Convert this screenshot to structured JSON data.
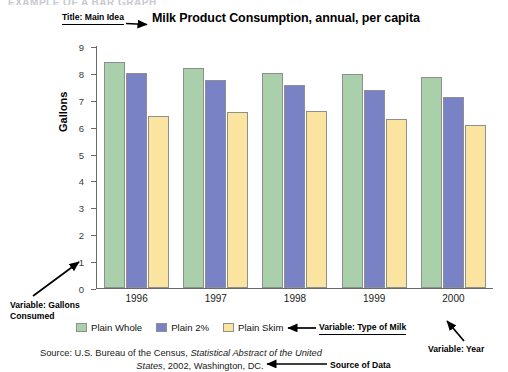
{
  "page": {
    "cutoff_header": "EXAMPLE OF A BAR GRAPH"
  },
  "chart_data": {
    "type": "bar",
    "title": "Milk Product Consumption, annual, per capita",
    "xlabel": "",
    "ylabel": "Gallons",
    "ylim": [
      0,
      9
    ],
    "yticks": [
      "0",
      "1",
      "2",
      "3",
      "4",
      "5",
      "6",
      "7",
      "8",
      "9"
    ],
    "grid": false,
    "legend_position": "bottom-left",
    "categories": [
      "1996",
      "1997",
      "1998",
      "1999",
      "2000"
    ],
    "series": [
      {
        "name": "Plain Whole",
        "color": "#a9cfab",
        "values": [
          8.4,
          8.2,
          8.0,
          7.95,
          7.85
        ]
      },
      {
        "name": "Plain 2%",
        "color": "#7a82c6",
        "values": [
          8.0,
          7.75,
          7.55,
          7.35,
          7.1
        ]
      },
      {
        "name": "Plain Skim",
        "color": "#fbe3a0",
        "values": [
          6.4,
          6.55,
          6.6,
          6.3,
          6.05
        ]
      }
    ]
  },
  "annotations": {
    "title_callout": "Title: Main Idea",
    "y_variable_callout": "Variable: Gallons Consumed",
    "series_variable_callout": "Variable: Type of Milk",
    "x_variable_callout": "Variable: Year",
    "source_callout": "Source of Data"
  },
  "source": {
    "line1_a": "Source: U.S. Bureau of the Census, ",
    "line1_b": "Statistical Abstract of the United",
    "line2_a": "States",
    "line2_b": ", 2002, Washington, DC."
  }
}
